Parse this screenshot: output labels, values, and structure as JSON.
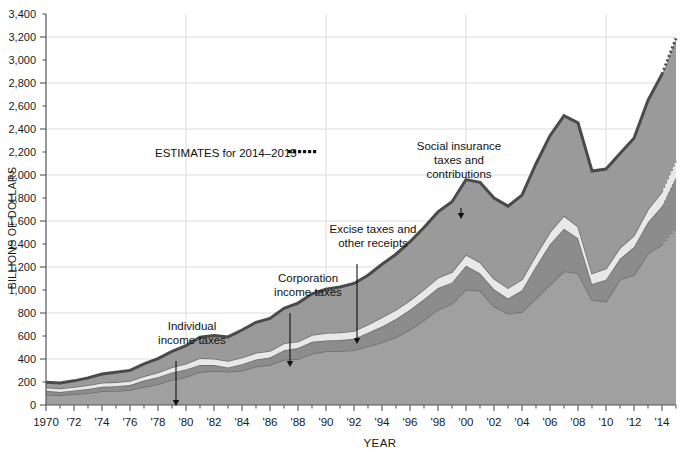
{
  "chart_data": {
    "type": "area",
    "title": "",
    "subtitle": "",
    "xlabel": "YEAR",
    "ylabel": "BILLIONS OF DOLLARS",
    "ylim": [
      0,
      3400
    ],
    "xlim": [
      1970,
      2015
    ],
    "grid": true,
    "grid_y_interval": 400,
    "grid_x_interval": 10,
    "y_tick_labels": [
      "0",
      "200",
      "400",
      "600",
      "800",
      "1,000",
      "1,200",
      "1,400",
      "1,600",
      "1,800",
      "2,000",
      "2,200",
      "2,400",
      "2,600",
      "2,800",
      "3,000",
      "3,200",
      "3,400"
    ],
    "y_tick_values": [
      0,
      200,
      400,
      600,
      800,
      1000,
      1200,
      1400,
      1600,
      1800,
      2000,
      2200,
      2400,
      2600,
      2800,
      3000,
      3200,
      3400
    ],
    "x_tick_labels": [
      "1970",
      "'72",
      "'74",
      "'76",
      "'78",
      "'80",
      "'82",
      "'84",
      "'86",
      "'88",
      "'90",
      "'92",
      "'94",
      "'96",
      "'98",
      "'00",
      "'02",
      "'04",
      "'06",
      "'08",
      "'10",
      "'12",
      "'14"
    ],
    "x_tick_values": [
      1970,
      1972,
      1974,
      1976,
      1978,
      1980,
      1982,
      1984,
      1986,
      1988,
      1990,
      1992,
      1994,
      1996,
      1998,
      2000,
      2002,
      2004,
      2006,
      2008,
      2010,
      2012,
      2014
    ],
    "x": [
      1970,
      1971,
      1972,
      1973,
      1974,
      1975,
      1976,
      1977,
      1978,
      1979,
      1980,
      1981,
      1982,
      1983,
      1984,
      1985,
      1986,
      1987,
      1988,
      1989,
      1990,
      1991,
      1992,
      1993,
      1994,
      1995,
      1996,
      1997,
      1998,
      1999,
      2000,
      2001,
      2002,
      2003,
      2004,
      2005,
      2006,
      2007,
      2008,
      2009,
      2010,
      2011,
      2012,
      2013,
      2014,
      2015
    ],
    "stack_order_bottom_to_top": [
      "individual_income_taxes",
      "corporation_income_taxes",
      "excise_taxes_and_other_receipts",
      "social_insurance_taxes_and_contributions"
    ],
    "estimate_start_year": 2014,
    "series": [
      {
        "name": "Individual income taxes",
        "key": "individual_income_taxes",
        "color": "#a0a0a0",
        "values": [
          90,
          86,
          94,
          103,
          119,
          122,
          131,
          157,
          181,
          217,
          244,
          286,
          298,
          289,
          298,
          335,
          349,
          393,
          401,
          446,
          467,
          468,
          476,
          510,
          543,
          590,
          656,
          737,
          829,
          879,
          1004,
          994,
          858,
          794,
          809,
          927,
          1044,
          1163,
          1146,
          915,
          899,
          1091,
          1132,
          1316,
          1395,
          1534
        ]
      },
      {
        "name": "Corporation income taxes",
        "key": "corporation_income_taxes",
        "color": "#8c8c8c",
        "values": [
          33,
          27,
          32,
          36,
          39,
          41,
          42,
          55,
          60,
          66,
          65,
          61,
          49,
          37,
          57,
          61,
          63,
          84,
          94,
          103,
          94,
          98,
          100,
          118,
          140,
          157,
          172,
          182,
          189,
          185,
          207,
          151,
          148,
          132,
          189,
          278,
          354,
          370,
          304,
          138,
          191,
          181,
          242,
          274,
          333,
          449
        ]
      },
      {
        "name": "Excise taxes and other receipts",
        "key": "excise_taxes_and_other_receipts",
        "color": "#e8e8e8",
        "values": [
          30,
          31,
          31,
          33,
          36,
          36,
          36,
          39,
          41,
          45,
          49,
          61,
          56,
          57,
          58,
          58,
          58,
          60,
          57,
          59,
          65,
          64,
          67,
          72,
          80,
          80,
          83,
          86,
          89,
          92,
          96,
          97,
          93,
          90,
          94,
          99,
          106,
          112,
          104,
          91,
          97,
          95,
          100,
          112,
          126,
          140
        ]
      },
      {
        "name": "Social insurance taxes and contributions",
        "key": "social_insurance_taxes_and_contributions",
        "color": "#9a9a9a",
        "values": [
          45,
          48,
          53,
          64,
          76,
          86,
          92,
          106,
          121,
          138,
          158,
          182,
          201,
          209,
          239,
          265,
          283,
          303,
          334,
          359,
          380,
          396,
          414,
          428,
          461,
          484,
          509,
          539,
          572,
          612,
          653,
          694,
          701,
          713,
          733,
          794,
          838,
          870,
          900,
          891,
          865,
          819,
          845,
          948,
          1023,
          1065
        ]
      }
    ],
    "totals": [
      198,
      192,
      210,
      236,
      270,
      285,
      301,
      357,
      403,
      466,
      516,
      590,
      604,
      592,
      652,
      719,
      753,
      840,
      886,
      967,
      1006,
      1026,
      1057,
      1128,
      1224,
      1311,
      1420,
      1544,
      1679,
      1768,
      1960,
      1936,
      1800,
      1729,
      1825,
      2098,
      2342,
      2515,
      2454,
      2035,
      2052,
      2186,
      2319,
      2650,
      2877,
      3188
    ],
    "annotations": [
      {
        "name": "individual-income-taxes",
        "label": "Individual\nincome taxes",
        "lines": [
          "Individual",
          "income taxes"
        ],
        "target_series": "individual_income_taxes"
      },
      {
        "name": "corporation-income-taxes",
        "label": "Corporation\nincome taxes",
        "lines": [
          "Corporation",
          "income taxes"
        ],
        "target_series": "corporation_income_taxes"
      },
      {
        "name": "excise-taxes-and-other-receipts",
        "label": "Excise taxes and\nother receipts",
        "lines": [
          "Excise taxes and",
          "other receipts"
        ],
        "target_series": "excise_taxes_and_other_receipts"
      },
      {
        "name": "social-insurance-taxes",
        "label": "Social insurance\ntaxes and\ncontributions",
        "lines": [
          "Social insurance",
          "taxes and",
          "contributions"
        ],
        "target_series": "social_insurance_taxes_and_contributions"
      }
    ],
    "estimates_note": "ESTIMATES for 2014–2015",
    "colors": {
      "background": "#ffffff",
      "grid": "#dcdcdc",
      "axis": "#555555",
      "outline": "#4a4a4a",
      "text": "#1a1a1a"
    }
  },
  "axes": {
    "y_title": "BILLIONS OF DOLLARS",
    "x_title": "YEAR"
  },
  "legend_note": {
    "text": "ESTIMATES for 2014–2015"
  }
}
